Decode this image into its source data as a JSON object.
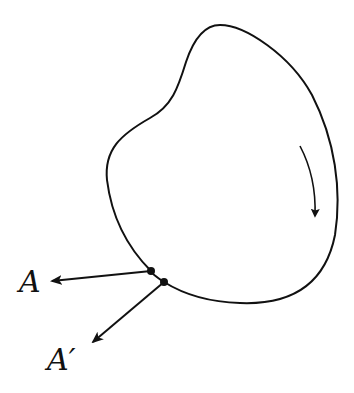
{
  "diagram": {
    "labels": {
      "point_a": "A",
      "point_a_prime": "A′"
    },
    "elements": [
      {
        "type": "closed-curve",
        "description": "irregular closed boundary"
      },
      {
        "type": "direction-arrow",
        "description": "clockwise circulation arrow inside curve"
      },
      {
        "type": "point",
        "label": "A",
        "description": "point on boundary with vector pointing left"
      },
      {
        "type": "point",
        "label": "A′",
        "description": "nearby point on boundary with vector pointing down-left"
      }
    ],
    "colors": {
      "stroke": "#111111",
      "background": "#ffffff"
    }
  }
}
